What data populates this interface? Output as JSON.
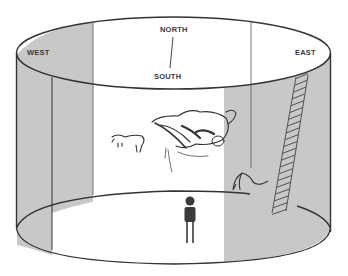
{
  "diagram": {
    "labels": {
      "north": "NORTH",
      "south": "SOUTH",
      "west": "WEST",
      "east": "EAST"
    },
    "colors": {
      "shade": "#c8c8c8",
      "line": "#333333",
      "background": "#ffffff",
      "figure": "#3a3a3a"
    },
    "elements": [
      "cylinder-outline",
      "west-shaded-wall",
      "east-shaded-wall",
      "cave-paintings",
      "ladder",
      "standing-person",
      "north-south-axis"
    ]
  }
}
